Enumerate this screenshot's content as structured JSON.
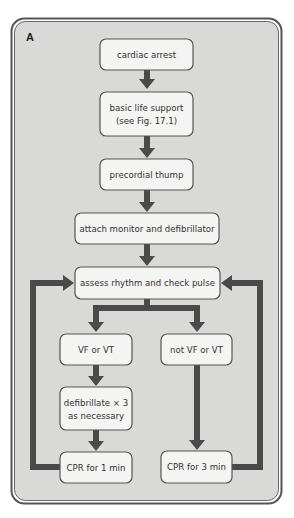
{
  "panel_label": "A",
  "colors": {
    "panel_fill": "#d9d9d7",
    "panel_border": "#555555",
    "box_fill": "#f4f4f2",
    "arrow": "#4a4a4a",
    "text": "#333333"
  },
  "nodes": {
    "cardiac_arrest": {
      "lines": [
        "cardiac arrest"
      ]
    },
    "basic_life_support": {
      "lines": [
        "basic life support",
        "(see Fig. 17.1)"
      ]
    },
    "precordial_thump": {
      "lines": [
        "precordial thump"
      ]
    },
    "attach_monitor": {
      "lines": [
        "attach monitor and defibrillator"
      ]
    },
    "assess_rhythm": {
      "lines": [
        "assess rhythm and check pulse"
      ]
    },
    "vf_vt": {
      "lines": [
        "VF or VT"
      ]
    },
    "not_vf_vt": {
      "lines": [
        "not VF or VT"
      ]
    },
    "defibrillate": {
      "lines": [
        "defibrillate × 3",
        "as necessary"
      ]
    },
    "cpr_1min": {
      "lines": [
        "CPR for 1 min"
      ]
    },
    "cpr_3min": {
      "lines": [
        "CPR for 3 min"
      ]
    }
  },
  "edges": [
    {
      "from": "cardiac_arrest",
      "to": "basic_life_support"
    },
    {
      "from": "basic_life_support",
      "to": "precordial_thump"
    },
    {
      "from": "precordial_thump",
      "to": "attach_monitor"
    },
    {
      "from": "attach_monitor",
      "to": "assess_rhythm"
    },
    {
      "from": "assess_rhythm",
      "to": "vf_vt"
    },
    {
      "from": "assess_rhythm",
      "to": "not_vf_vt"
    },
    {
      "from": "vf_vt",
      "to": "defibrillate"
    },
    {
      "from": "defibrillate",
      "to": "cpr_1min"
    },
    {
      "from": "not_vf_vt",
      "to": "cpr_3min"
    },
    {
      "from": "cpr_1min",
      "to": "assess_rhythm"
    },
    {
      "from": "cpr_3min",
      "to": "assess_rhythm"
    }
  ]
}
